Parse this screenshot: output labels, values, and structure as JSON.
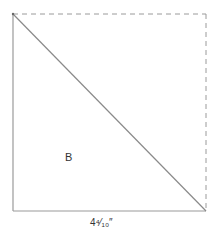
{
  "diagram": {
    "type": "square-with-diagonal",
    "region_label": "B",
    "side_length_label": "4⁴⁄₁₀″",
    "edges": {
      "left": "solid",
      "bottom": "solid",
      "top": "dashed",
      "right": "dashed",
      "diagonal": "solid (top-left to bottom-right)"
    },
    "colors": {
      "line": "#9a9a9a",
      "text": "#333333",
      "background": "#ffffff"
    }
  }
}
